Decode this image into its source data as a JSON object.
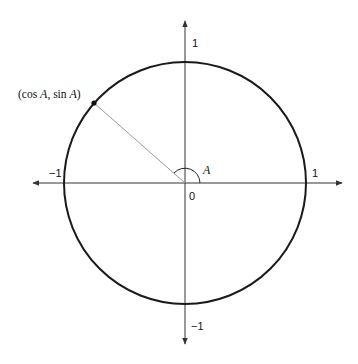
{
  "diagram": {
    "point_label_prefix": "(cos ",
    "point_label_A1": "A",
    "point_label_mid": ", sin ",
    "point_label_A2": "A",
    "point_label_suffix": ")",
    "angle_label": "A",
    "origin_label": "0",
    "x_axis": {
      "pos_tick": "1",
      "neg_tick": "−1"
    },
    "y_axis": {
      "pos_tick": "1",
      "neg_tick": "−1"
    },
    "colors": {
      "circle": "#1a1a1a",
      "axes": "#333333",
      "radius": "#9a9a9a",
      "point": "#111111"
    }
  }
}
